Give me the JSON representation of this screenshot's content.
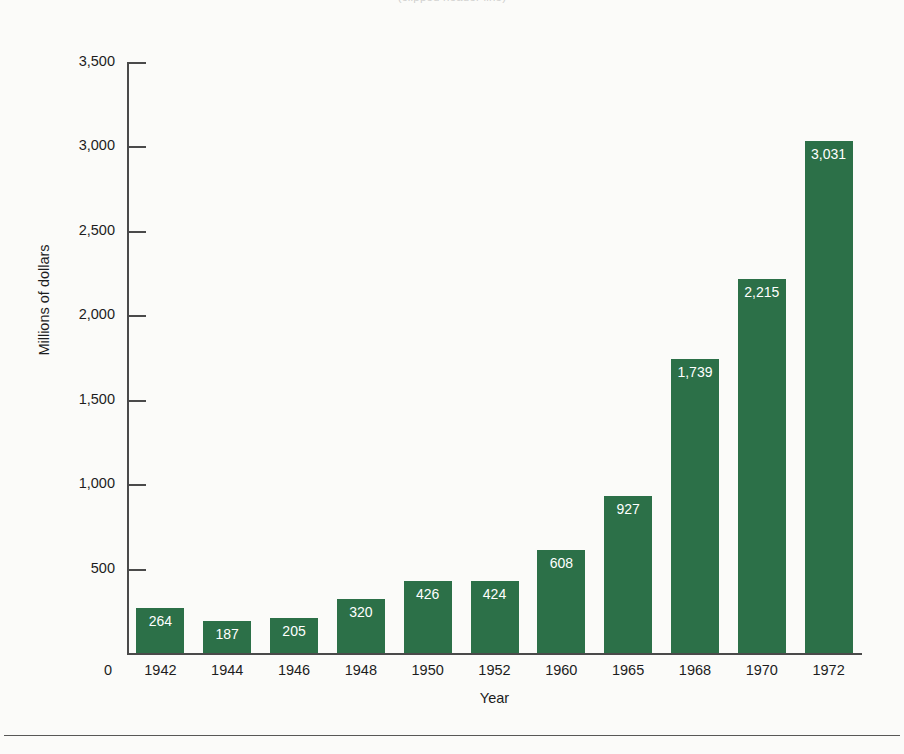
{
  "caption": {
    "text": "(clipped header line)"
  },
  "chart_data": {
    "type": "bar",
    "title": "",
    "xlabel": "Year",
    "ylabel": "Millions of dollars",
    "categories": [
      "1942",
      "1944",
      "1946",
      "1948",
      "1950",
      "1952",
      "1960",
      "1965",
      "1968",
      "1970",
      "1972"
    ],
    "values": [
      264,
      187,
      205,
      320,
      426,
      424,
      608,
      927,
      1739,
      2215,
      3031
    ],
    "value_labels": [
      "264",
      "187",
      "205",
      "320",
      "426",
      "424",
      "608",
      "927",
      "1,739",
      "2,215",
      "3,031"
    ],
    "ylim": [
      0,
      3500
    ],
    "yticks": [
      0,
      500,
      1000,
      1500,
      2000,
      2500,
      3000,
      3500
    ],
    "ytick_labels": [
      "0",
      "500",
      "1,000",
      "1,500",
      "2,000",
      "2,500",
      "3,000",
      "3,500"
    ],
    "grid": false,
    "legend": false,
    "bar_color": "#2c7048",
    "bar_label_color": "#ffffff",
    "axis_color": "#4a4a4a",
    "background": "#fbfbf9"
  }
}
